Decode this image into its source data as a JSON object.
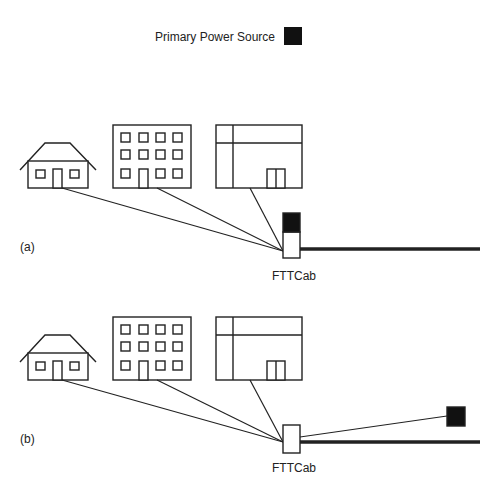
{
  "legend": {
    "label": "Primary Power Source",
    "swatch_color": "#111111"
  },
  "panels": [
    {
      "id": "a",
      "label": "(a)",
      "cabinet_label": "FTTCab",
      "power_location": "on cabinet"
    },
    {
      "id": "b",
      "label": "(b)",
      "cabinet_label": "FTTCab",
      "power_location": "remote, linked to cabinet"
    }
  ],
  "buildings": [
    "house",
    "apartment-block",
    "commercial-building"
  ],
  "colors": {
    "line": "#222222",
    "fill": "#ffffff",
    "power": "#111111"
  }
}
